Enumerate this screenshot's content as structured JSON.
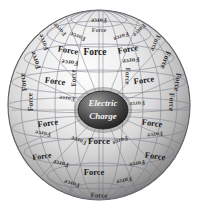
{
  "figure": {
    "name": "electric-charge-force-sphere",
    "background_color": "#ffffff",
    "sphere": {
      "center_x": 99,
      "center_y": 105,
      "radius_x": 91,
      "radius_y": 95,
      "rim_color": "#6e6e6e",
      "highlight_color": "#fbfbfb",
      "mid_color": "#cfcfcf",
      "outline_color": "#555555",
      "grid_color": "#7b7b88"
    },
    "core": {
      "label_line_1": "Electric",
      "label_line_2": "Charge",
      "center_x": 103,
      "center_y": 110,
      "radius_x": 25,
      "radius_y": 19,
      "fill_dark": "#2e2e2e",
      "fill_light": "#8f8f8f",
      "text_color": "#f2f2f2",
      "font_size": 9
    },
    "force_label_text": "Force",
    "force_labels": [
      {
        "text": "Force",
        "x": 99,
        "y": 20,
        "rotate": 178,
        "size": 6.5,
        "opacity": 0.85
      },
      {
        "text": "Force",
        "x": 99,
        "y": 31,
        "rotate": 0,
        "size": 6.0,
        "opacity": 0.7
      },
      {
        "text": "Force",
        "x": 78,
        "y": 36,
        "rotate": 200,
        "size": 6.5,
        "opacity": 0.8
      },
      {
        "text": "Force",
        "x": 121,
        "y": 36,
        "rotate": 160,
        "size": 6.5,
        "opacity": 0.8
      },
      {
        "text": "Force",
        "x": 60,
        "y": 29,
        "rotate": 225,
        "size": 6.5,
        "opacity": 0.75
      },
      {
        "text": "Force",
        "x": 139,
        "y": 30,
        "rotate": 135,
        "size": 6.5,
        "opacity": 0.75
      },
      {
        "text": "Force",
        "x": 44,
        "y": 42,
        "rotate": 248,
        "size": 7.0,
        "opacity": 0.8
      },
      {
        "text": "Force",
        "x": 155,
        "y": 43,
        "rotate": 112,
        "size": 7.0,
        "opacity": 0.8
      },
      {
        "text": "Force",
        "x": 95,
        "y": 53,
        "rotate": 0,
        "size": 9.5,
        "opacity": 1
      },
      {
        "text": "Force",
        "x": 68,
        "y": 51,
        "rotate": 10,
        "size": 8.5,
        "opacity": 1
      },
      {
        "text": "Force",
        "x": 128,
        "y": 50,
        "rotate": 350,
        "size": 8.5,
        "opacity": 1
      },
      {
        "text": "Force",
        "x": 70,
        "y": 62,
        "rotate": 186,
        "size": 7.0,
        "opacity": 0.85
      },
      {
        "text": "Force",
        "x": 131,
        "y": 60,
        "rotate": 173,
        "size": 7.0,
        "opacity": 0.85
      },
      {
        "text": "Force",
        "x": 36,
        "y": 60,
        "rotate": 250,
        "size": 7.5,
        "opacity": 0.9
      },
      {
        "text": "Force",
        "x": 165,
        "y": 60,
        "rotate": 110,
        "size": 7.5,
        "opacity": 0.9
      },
      {
        "text": "Force",
        "x": 55,
        "y": 82,
        "rotate": 8,
        "size": 8.5,
        "opacity": 1
      },
      {
        "text": "Force",
        "x": 144,
        "y": 81,
        "rotate": 352,
        "size": 8.5,
        "opacity": 1
      },
      {
        "text": "Force",
        "x": 74,
        "y": 78,
        "rotate": 268,
        "size": 7.0,
        "opacity": 0.8
      },
      {
        "text": "Force",
        "x": 127,
        "y": 76,
        "rotate": 92,
        "size": 7.0,
        "opacity": 0.8
      },
      {
        "text": "Force",
        "x": 24,
        "y": 82,
        "rotate": 262,
        "size": 7.5,
        "opacity": 0.85
      },
      {
        "text": "Force",
        "x": 177,
        "y": 82,
        "rotate": 98,
        "size": 7.5,
        "opacity": 0.85
      },
      {
        "text": "Force",
        "x": 31,
        "y": 102,
        "rotate": 268,
        "size": 7.5,
        "opacity": 0.85
      },
      {
        "text": "Force",
        "x": 171,
        "y": 102,
        "rotate": 92,
        "size": 7.5,
        "opacity": 0.85
      },
      {
        "text": "Force",
        "x": 67,
        "y": 98,
        "rotate": 186,
        "size": 6.5,
        "opacity": 0.7
      },
      {
        "text": "Force",
        "x": 137,
        "y": 103,
        "rotate": 175,
        "size": 6.5,
        "opacity": 0.7
      },
      {
        "text": "Force",
        "x": 48,
        "y": 124,
        "rotate": 352,
        "size": 8.5,
        "opacity": 1
      },
      {
        "text": "Force",
        "x": 152,
        "y": 124,
        "rotate": 8,
        "size": 8.5,
        "opacity": 1
      },
      {
        "text": "Force",
        "x": 43,
        "y": 133,
        "rotate": 188,
        "size": 6.5,
        "opacity": 0.75
      },
      {
        "text": "Force",
        "x": 155,
        "y": 134,
        "rotate": 172,
        "size": 6.5,
        "opacity": 0.75
      },
      {
        "text": "Force",
        "x": 99,
        "y": 142,
        "rotate": 0,
        "size": 9.0,
        "opacity": 1
      },
      {
        "text": "Force",
        "x": 79,
        "y": 140,
        "rotate": 200,
        "size": 6.5,
        "opacity": 0.8
      },
      {
        "text": "Force",
        "x": 120,
        "y": 140,
        "rotate": 160,
        "size": 6.5,
        "opacity": 0.8
      },
      {
        "text": "Force",
        "x": 42,
        "y": 157,
        "rotate": 352,
        "size": 8.0,
        "opacity": 1
      },
      {
        "text": "Force",
        "x": 155,
        "y": 157,
        "rotate": 8,
        "size": 8.5,
        "opacity": 1
      },
      {
        "text": "Force",
        "x": 61,
        "y": 163,
        "rotate": 192,
        "size": 6.5,
        "opacity": 0.8
      },
      {
        "text": "Force",
        "x": 137,
        "y": 163,
        "rotate": 168,
        "size": 6.5,
        "opacity": 0.8
      },
      {
        "text": "Force",
        "x": 94,
        "y": 173,
        "rotate": 0,
        "size": 8.5,
        "opacity": 1
      },
      {
        "text": "Force",
        "x": 72,
        "y": 183,
        "rotate": 196,
        "size": 6.5,
        "opacity": 0.8
      },
      {
        "text": "Force",
        "x": 124,
        "y": 180,
        "rotate": 166,
        "size": 6.5,
        "opacity": 0.8
      },
      {
        "text": "Force",
        "x": 99,
        "y": 196,
        "rotate": 2,
        "size": 7.0,
        "opacity": 0.8
      }
    ],
    "meridian_count": 12,
    "parallel_count": 7
  }
}
